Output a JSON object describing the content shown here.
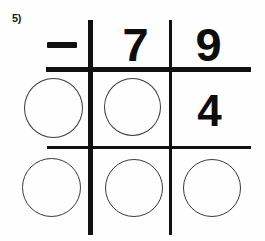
{
  "worksheet": {
    "problem_label": "5)",
    "operator_symbol": "minus-sign",
    "operator_text": "−"
  },
  "problem": {
    "operator": "−",
    "minuend_digits": [
      "7",
      "9"
    ],
    "partial_digits": [
      "4"
    ],
    "rows": [
      {
        "name": "minuend-row",
        "cells": [
          {
            "name": "operator-cell",
            "type": "operator",
            "value": "−"
          },
          {
            "name": "tens-cell",
            "type": "digit",
            "value": "7"
          },
          {
            "name": "ones-cell",
            "type": "digit",
            "value": "9"
          }
        ]
      },
      {
        "name": "subtrahend-row",
        "cells": [
          {
            "name": "hundreds-blank",
            "type": "circle",
            "value": ""
          },
          {
            "name": "tens-blank",
            "type": "circle",
            "value": ""
          },
          {
            "name": "ones-cell",
            "type": "digit",
            "value": "4"
          }
        ]
      },
      {
        "name": "difference-row",
        "cells": [
          {
            "name": "hundreds-blank",
            "type": "circle",
            "value": ""
          },
          {
            "name": "tens-blank",
            "type": "circle",
            "value": ""
          },
          {
            "name": "ones-blank",
            "type": "circle",
            "value": ""
          }
        ]
      }
    ]
  },
  "colors": {
    "ink": "#111111",
    "digit_ink": "#0d0d0d",
    "circle_stroke": "#3a3a3a",
    "paper": "#fefefe"
  }
}
